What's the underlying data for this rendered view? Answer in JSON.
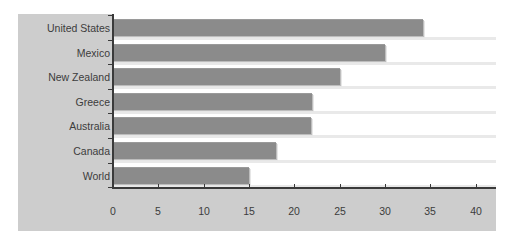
{
  "chart_data": {
    "type": "bar",
    "orientation": "horizontal",
    "title": "",
    "xlabel": "",
    "ylabel": "",
    "categories": [
      "United States",
      "Mexico",
      "New Zealand",
      "Greece",
      "Australia",
      "Canada",
      "World"
    ],
    "values": [
      34.2,
      30.0,
      25.0,
      21.9,
      21.8,
      18.0,
      15.0
    ],
    "xlim": [
      0,
      42
    ],
    "xticks": [
      0,
      5,
      10,
      15,
      20,
      25,
      30,
      35,
      40
    ],
    "grid": false,
    "legend": null,
    "colors": {
      "bar": "#8b8b8b",
      "panel": "#cdcdcd",
      "axis": "#3a3a3a",
      "text": "#3c3c3c"
    }
  },
  "labels": {
    "categories": [
      "United States",
      "Mexico",
      "New Zealand",
      "Greece",
      "Australia",
      "Canada",
      "World"
    ],
    "xticks": [
      "0",
      "5",
      "10",
      "15",
      "20",
      "25",
      "30",
      "35",
      "40"
    ]
  }
}
